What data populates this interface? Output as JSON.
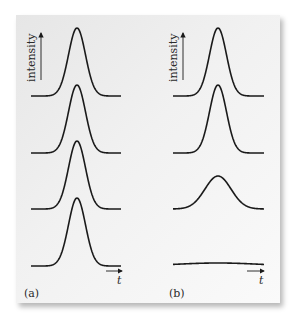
{
  "figure": {
    "panels": [
      {
        "id": "a",
        "label": "(a)",
        "y_axis_label": "intensity",
        "x_axis_label": "t",
        "traces": [
          {
            "baseline_y": 96,
            "peak_height": 68,
            "width": 8.5
          },
          {
            "baseline_y": 153,
            "peak_height": 68,
            "width": 8.5
          },
          {
            "baseline_y": 209,
            "peak_height": 68,
            "width": 8.5
          },
          {
            "baseline_y": 266,
            "peak_height": 68,
            "width": 8.5
          }
        ]
      },
      {
        "id": "b",
        "label": "(b)",
        "y_axis_label": "intensity",
        "x_axis_label": "t",
        "traces": [
          {
            "baseline_y": 96,
            "peak_height": 68,
            "width": 8.5
          },
          {
            "baseline_y": 153,
            "peak_height": 68,
            "width": 8.5
          },
          {
            "baseline_y": 209,
            "peak_height": 33,
            "width": 13
          },
          {
            "baseline_y": 266,
            "peak_height": 3,
            "width": 40
          }
        ]
      }
    ],
    "colors": {
      "line": "#1a1a1a",
      "background": "#eeeeee"
    }
  }
}
